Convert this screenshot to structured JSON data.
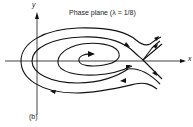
{
  "figure": {
    "title": "Phase plane  (λ = 1/8)",
    "panel_label": "(b)",
    "axes": {
      "x_label": "x",
      "y_label": "y"
    },
    "colors": {
      "stroke": "#111111",
      "background": "#ffffff"
    },
    "features": {
      "spiral_center": "unstable focus near origin region",
      "saddle_point": "on x-axis to the right",
      "trajectories": [
        "inner spiral",
        "middle loop",
        "outer loop",
        "separatrices"
      ]
    }
  }
}
